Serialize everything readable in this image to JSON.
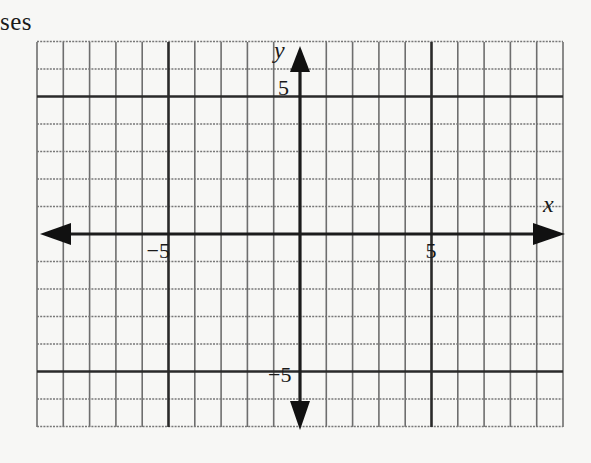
{
  "caption": "ses",
  "plane": {
    "x_min": -10,
    "x_max": 10,
    "y_min": -7,
    "y_max": 7,
    "grid_step": 1,
    "major_lines_x": [
      -5,
      5
    ],
    "major_lines_y": [
      -5,
      5
    ],
    "axis_labels": {
      "x": "x",
      "y": "y"
    },
    "tick_labels": {
      "x_neg5": "−5",
      "x_pos5": "5",
      "y_pos5": "5",
      "y_neg5": "−5"
    },
    "colors": {
      "grid": "#6e6e6e",
      "major": "#2a2a2a",
      "axis": "#1c1c1c",
      "background": "#f7f7f5"
    }
  }
}
